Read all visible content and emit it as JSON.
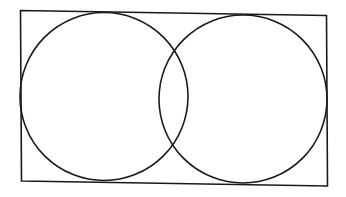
{
  "diagram": {
    "shapes": [
      {
        "kind": "rectangle",
        "role": "bounding-rectangle"
      },
      {
        "kind": "circle",
        "role": "left-circle"
      },
      {
        "kind": "circle",
        "role": "right-circle"
      }
    ],
    "stroke_color": "#1a1a1a",
    "background_color": "#ffffff"
  }
}
